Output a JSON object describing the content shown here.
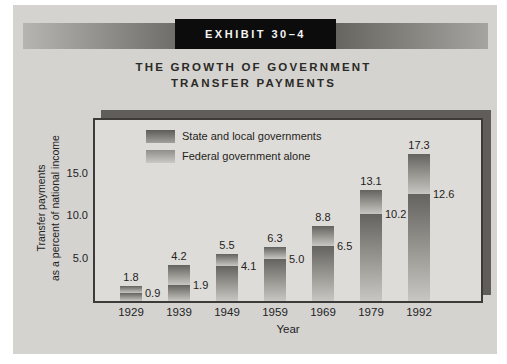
{
  "exhibit": {
    "banner_label": "EXHIBIT 30–4",
    "title_line1": "THE GROWTH OF GOVERNMENT",
    "title_line2": "TRANSFER PAYMENTS"
  },
  "chart_data": {
    "type": "bar",
    "subtype": "stacked",
    "title": "The Growth of Government Transfer Payments",
    "categories": [
      "1929",
      "1939",
      "1949",
      "1959",
      "1969",
      "1979",
      "1992"
    ],
    "bar_totals": [
      1.8,
      4.2,
      5.5,
      6.3,
      8.8,
      13.1,
      17.3
    ],
    "federal_values": [
      0.9,
      1.9,
      4.1,
      5.0,
      6.5,
      10.2,
      12.6
    ],
    "series": [
      {
        "name": "State and local governments",
        "segment": "top",
        "labeled_value": "bar total, shown above bar"
      },
      {
        "name": "Federal government alone",
        "segment": "bottom",
        "labeled_value": "shown right of bar at segment boundary"
      }
    ],
    "xlabel": "Year",
    "ylabel_line1": "Transfer payments",
    "ylabel_line2": "as a percent of national income",
    "yticks": [
      "5.0",
      "10.0",
      "15.0"
    ],
    "ylim": [
      0,
      21.5
    ],
    "grid": false,
    "legend_position": "top-left inside plot",
    "colors": {
      "bar_gradient_top": "#646360",
      "bar_gradient_bottom": "#c7c6c2",
      "panel_bg": "#dedcd8",
      "panel_shadow": "#605d5a",
      "card_bg": "#d4d3cf",
      "banner_bg": "#0c0c0c"
    }
  }
}
